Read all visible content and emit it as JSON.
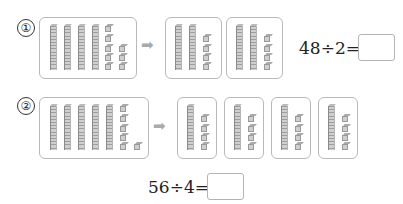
{
  "problems": [
    {
      "number": "①",
      "equation": "48÷2=",
      "source_blocks": {
        "tens": 4,
        "ones": 8
      },
      "groups": [
        {
          "tens": 2,
          "ones": 4
        },
        {
          "tens": 2,
          "ones": 4
        }
      ],
      "answer": ""
    },
    {
      "number": "②",
      "equation": "56÷4=",
      "source_blocks": {
        "tens": 5,
        "ones": 6
      },
      "groups": [
        {
          "tens": 1,
          "ones": 4
        },
        {
          "tens": 1,
          "ones": 4
        },
        {
          "tens": 1,
          "ones": 4
        },
        {
          "tens": 1,
          "ones": 4
        }
      ],
      "answer": ""
    }
  ],
  "arrow_icon": "right-arrow-icon"
}
